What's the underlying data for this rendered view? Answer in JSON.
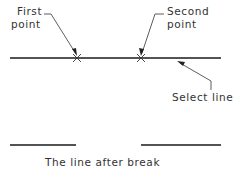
{
  "diagram": {
    "labels": {
      "first_point_line1": "First",
      "first_point_line2": "point",
      "second_point_line1": "Second",
      "second_point_line2": "point",
      "select_line": "Select line",
      "caption": "The line after break"
    },
    "colors": {
      "line": "#1a1a1a",
      "text": "#333333",
      "background": "#ffffff"
    },
    "markers": [
      {
        "name": "first-point",
        "icon": "cross-mark",
        "x": 77,
        "y": 58
      },
      {
        "name": "second-point",
        "icon": "cross-mark",
        "x": 141,
        "y": 58
      }
    ]
  }
}
